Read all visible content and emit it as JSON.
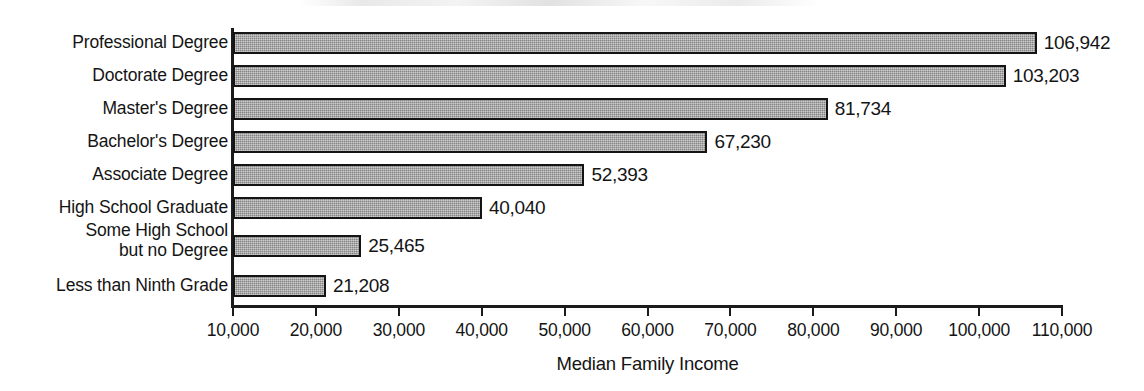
{
  "chart_data": {
    "type": "bar",
    "orientation": "horizontal",
    "title": "",
    "xlabel": "Median Family Income",
    "ylabel": "",
    "categories": [
      "Professional Degree",
      "Doctorate Degree",
      "Master's Degree",
      "Bachelor's Degree",
      "Associate Degree",
      "High School Graduate",
      "Some High School\nbut no Degree",
      "Less than Ninth Grade"
    ],
    "values": [
      106942,
      103203,
      81734,
      67230,
      52393,
      40040,
      25465,
      21208
    ],
    "value_labels": [
      "106,942",
      "103,203",
      "81,734",
      "67,230",
      "52,393",
      "40,040",
      "25,465",
      "21,208"
    ],
    "xticks": [
      10000,
      20000,
      30000,
      40000,
      50000,
      60000,
      70000,
      80000,
      90000,
      100000,
      110000
    ],
    "xtick_labels": [
      "10,000",
      "20,000",
      "30,000",
      "40,000",
      "50,000",
      "60,000",
      "70,000",
      "80,000",
      "90,000",
      "100,000",
      "110,000"
    ],
    "xlim": [
      10000,
      110000
    ],
    "grid": false,
    "legend": false,
    "bar_fill_color": "#9d9d9d",
    "bar_edge_color": "#141414",
    "background_color": "#ffffff"
  }
}
